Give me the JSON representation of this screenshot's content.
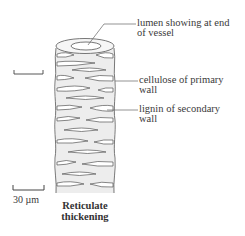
{
  "diagram": {
    "type": "xylem vessel illustration",
    "caption_line1": "Reticulate",
    "caption_line2": "thickening",
    "labels": [
      {
        "id": "lumen",
        "line1": "lumen showing at end",
        "line2": "of vessel"
      },
      {
        "id": "cellulose",
        "line1": "cellulose of primary",
        "line2": "wall"
      },
      {
        "id": "lignin",
        "line1": "lignin of secondary",
        "line2": "wall"
      }
    ],
    "scale_bar": {
      "label": "30 µm"
    },
    "colors": {
      "line": "#555555",
      "fill": "#ececec",
      "background": "#ffffff"
    }
  }
}
